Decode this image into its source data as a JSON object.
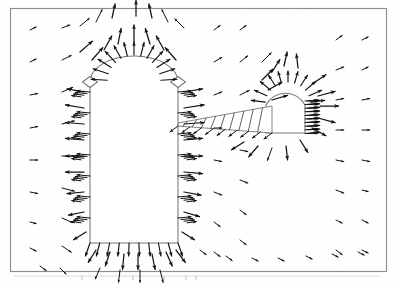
{
  "figure": {
    "title": "",
    "caption": "",
    "kind": "vector-field-quiver-plot",
    "background_color": "#fefefd",
    "frame_color": "#8e8e8e",
    "arrow_color": "#121212",
    "outline_color": "#777777"
  },
  "frame": {
    "x": 10,
    "y": 8,
    "width": 377,
    "height": 264
  },
  "axis_ticks": {
    "visible": true,
    "y": 276,
    "color": "#b4b4b4",
    "x_positions": [
      82,
      133,
      164,
      186,
      196
    ]
  },
  "obstacles": [
    {
      "name": "left-rounded-body",
      "type": "round-topped-rectangle",
      "left": 90,
      "right": 178,
      "top_arc_peak_y": 56,
      "shoulder_y": 82,
      "bottom_y": 243,
      "shoulder_diamonds": [
        {
          "cx": 90,
          "cy": 82,
          "w": 15,
          "h": 11
        },
        {
          "cx": 178,
          "cy": 82,
          "w": 15,
          "h": 11
        }
      ]
    },
    {
      "name": "right-dome-body",
      "type": "dome-with-wall",
      "dome_cx": 288,
      "dome_cy": 105,
      "dome_r": 22,
      "right_wall_x": 305,
      "bottom_y": 133,
      "left_edge_x": 266
    },
    {
      "name": "hatched-wedge-slab",
      "type": "tapered-hatched-plate",
      "tip_x": 178,
      "tip_y": 123,
      "tail_x": 272,
      "top_y": 106,
      "bottom_y": 133,
      "hatch_line_count": 9
    }
  ],
  "chart_data": {
    "type": "scatter",
    "title": "",
    "xlabel": "",
    "ylabel": "",
    "grid": false,
    "legend": null,
    "grid_spacing_x": 20,
    "grid_spacing_y": 20,
    "xlim": [
      0,
      394
    ],
    "ylim": [
      0,
      286
    ],
    "arrow_scale": 1.0,
    "series": [
      {
        "name": "velocity-vectors",
        "note": "Each datum is [x, y, dx, dy] in screen pixel coordinates; dx,dy give arrow direction and relative magnitude.",
        "values": [
          [
            30,
            30,
            4,
            -2
          ],
          [
            30,
            62,
            4,
            -2
          ],
          [
            30,
            95,
            5,
            -1
          ],
          [
            30,
            128,
            5,
            -1
          ],
          [
            30,
            160,
            5,
            0
          ],
          [
            30,
            192,
            5,
            1
          ],
          [
            30,
            222,
            4,
            1
          ],
          [
            30,
            248,
            4,
            2
          ],
          [
            62,
            28,
            5,
            -2
          ],
          [
            62,
            60,
            6,
            -3
          ],
          [
            62,
            92,
            7,
            -3
          ],
          [
            62,
            124,
            8,
            -2
          ],
          [
            62,
            156,
            8,
            0
          ],
          [
            62,
            188,
            8,
            2
          ],
          [
            62,
            218,
            7,
            3
          ],
          [
            62,
            246,
            6,
            4
          ],
          [
            80,
            26,
            6,
            -5
          ],
          [
            80,
            52,
            8,
            -7
          ],
          [
            96,
            22,
            4,
            -8
          ],
          [
            112,
            18,
            2,
            -9
          ],
          [
            136,
            16,
            0,
            -10
          ],
          [
            152,
            18,
            -2,
            -9
          ],
          [
            168,
            22,
            -4,
            -8
          ],
          [
            184,
            28,
            -6,
            -6
          ],
          [
            92,
            60,
            7,
            -8
          ],
          [
            104,
            50,
            5,
            -9
          ],
          [
            118,
            44,
            2,
            -10
          ],
          [
            134,
            42,
            0,
            -11
          ],
          [
            150,
            44,
            -3,
            -10
          ],
          [
            164,
            50,
            -5,
            -9
          ],
          [
            176,
            60,
            -7,
            -8
          ],
          [
            84,
            92,
            -11,
            -2
          ],
          [
            84,
            108,
            -12,
            -2
          ],
          [
            84,
            124,
            -12,
            -1
          ],
          [
            84,
            140,
            -12,
            -1
          ],
          [
            84,
            156,
            -12,
            0
          ],
          [
            84,
            172,
            -12,
            0
          ],
          [
            84,
            192,
            -11,
            1
          ],
          [
            84,
            212,
            -10,
            2
          ],
          [
            86,
            232,
            -8,
            5
          ],
          [
            184,
            92,
            12,
            -2
          ],
          [
            184,
            108,
            13,
            -2
          ],
          [
            184,
            124,
            13,
            -1
          ],
          [
            184,
            140,
            12,
            -1
          ],
          [
            184,
            156,
            12,
            0
          ],
          [
            184,
            172,
            12,
            1
          ],
          [
            184,
            192,
            11,
            2
          ],
          [
            184,
            212,
            10,
            3
          ],
          [
            182,
            232,
            8,
            5
          ],
          [
            96,
            250,
            -5,
            8
          ],
          [
            110,
            252,
            -3,
            9
          ],
          [
            124,
            254,
            -1,
            10
          ],
          [
            138,
            254,
            0,
            10
          ],
          [
            152,
            254,
            2,
            10
          ],
          [
            166,
            252,
            4,
            9
          ],
          [
            176,
            250,
            6,
            8
          ],
          [
            100,
            268,
            -3,
            7
          ],
          [
            120,
            270,
            -1,
            8
          ],
          [
            140,
            270,
            0,
            8
          ],
          [
            160,
            270,
            2,
            8
          ],
          [
            60,
            268,
            4,
            4
          ],
          [
            40,
            266,
            4,
            3
          ],
          [
            214,
            30,
            4,
            -3
          ],
          [
            214,
            62,
            5,
            -3
          ],
          [
            214,
            95,
            5,
            -2
          ],
          [
            214,
            128,
            5,
            0
          ],
          [
            214,
            160,
            5,
            1
          ],
          [
            214,
            192,
            5,
            2
          ],
          [
            214,
            222,
            4,
            3
          ],
          [
            214,
            252,
            4,
            3
          ],
          [
            240,
            30,
            4,
            -3
          ],
          [
            240,
            62,
            5,
            -4
          ],
          [
            240,
            95,
            6,
            -3
          ],
          [
            240,
            150,
            5,
            1
          ],
          [
            240,
            180,
            5,
            2
          ],
          [
            240,
            210,
            4,
            3
          ],
          [
            240,
            240,
            4,
            3
          ],
          [
            262,
            62,
            6,
            -6
          ],
          [
            262,
            80,
            7,
            -7
          ],
          [
            272,
            72,
            5,
            -8
          ],
          [
            284,
            66,
            2,
            -9
          ],
          [
            298,
            68,
            -1,
            -9
          ],
          [
            268,
            90,
            9,
            -5
          ],
          [
            272,
            100,
            10,
            -3
          ],
          [
            312,
            84,
            9,
            -6
          ],
          [
            318,
            96,
            11,
            -3
          ],
          [
            320,
            106,
            12,
            0
          ],
          [
            318,
            118,
            11,
            3
          ],
          [
            312,
            128,
            9,
            5
          ],
          [
            300,
            140,
            5,
            8
          ],
          [
            286,
            146,
            1,
            9
          ],
          [
            272,
            148,
            -3,
            8
          ],
          [
            258,
            146,
            -6,
            7
          ],
          [
            244,
            142,
            -8,
            5
          ],
          [
            336,
            40,
            4,
            -3
          ],
          [
            336,
            70,
            5,
            -2
          ],
          [
            336,
            100,
            5,
            -1
          ],
          [
            336,
            130,
            5,
            0
          ],
          [
            336,
            160,
            5,
            1
          ],
          [
            336,
            190,
            5,
            2
          ],
          [
            336,
            220,
            4,
            2
          ],
          [
            336,
            250,
            4,
            3
          ],
          [
            362,
            40,
            4,
            -2
          ],
          [
            362,
            70,
            4,
            -2
          ],
          [
            362,
            100,
            5,
            -1
          ],
          [
            362,
            130,
            5,
            0
          ],
          [
            362,
            160,
            5,
            1
          ],
          [
            362,
            190,
            4,
            1
          ],
          [
            362,
            220,
            4,
            2
          ],
          [
            362,
            250,
            4,
            2
          ],
          [
            200,
            250,
            4,
            3
          ],
          [
            226,
            256,
            4,
            3
          ],
          [
            252,
            258,
            4,
            2
          ],
          [
            278,
            258,
            4,
            2
          ],
          [
            306,
            256,
            4,
            2
          ],
          [
            332,
            254,
            4,
            2
          ],
          [
            358,
            252,
            4,
            2
          ]
        ]
      }
    ]
  }
}
